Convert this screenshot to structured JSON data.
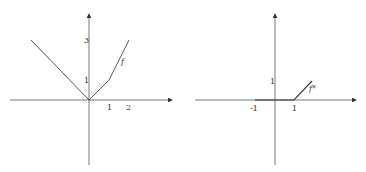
{
  "left_plot": {
    "function_label": "f",
    "x_ticks": [
      "1",
      "2"
    ],
    "y_ticks": [
      "1",
      "3"
    ],
    "points": [
      [
        -3,
        3
      ],
      [
        0,
        0
      ],
      [
        1,
        1
      ],
      [
        2,
        3
      ]
    ]
  },
  "right_plot": {
    "function_label": "f*",
    "x_ticks": [
      "-1",
      "1"
    ],
    "y_ticks": [
      "1"
    ],
    "points": [
      [
        -1,
        0
      ],
      [
        1,
        0
      ],
      [
        2,
        1
      ]
    ]
  },
  "colors": {
    "axis": "#555555",
    "curve": "#444444",
    "text": "#333333"
  }
}
